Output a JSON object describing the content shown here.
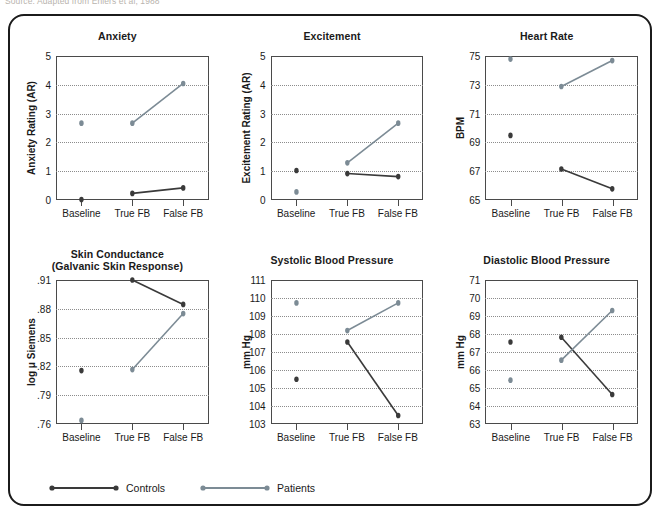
{
  "source_note": "Source: Adapted from Ehlers et al, 1988",
  "series_colors": {
    "controls": "#3a3a3a",
    "patients": "#7c8b95"
  },
  "legend": {
    "items": [
      {
        "label": "Controls",
        "key": "controls",
        "swatch": "line-with-dots-icon"
      },
      {
        "label": "Patients",
        "key": "patients",
        "swatch": "line-with-dots-icon"
      }
    ]
  },
  "chart_data": [
    {
      "type": "line",
      "title": "Anxiety",
      "xlabel": "",
      "ylabel": "Anxiety Rating (AR)",
      "categories": [
        "Baseline",
        "True FB",
        "False FB"
      ],
      "ylim": [
        0,
        5
      ],
      "yticks": [
        0,
        1,
        2,
        3,
        4,
        5
      ],
      "ytick_labels": [
        "0",
        "1",
        "2",
        "3",
        "4",
        "5"
      ],
      "grid": true,
      "baseline_disconnected": true,
      "series": [
        {
          "name": "Controls",
          "key": "controls",
          "values": [
            0.3,
            0.5,
            0.68
          ]
        },
        {
          "name": "Patients",
          "key": "patients",
          "values": [
            2.8,
            2.8,
            4.1
          ]
        }
      ]
    },
    {
      "type": "line",
      "title": "Excitement",
      "xlabel": "",
      "ylabel": "Excitement Rating (AR)",
      "categories": [
        "Baseline",
        "True FB",
        "False FB"
      ],
      "ylim": [
        0,
        5
      ],
      "yticks": [
        0,
        1,
        2,
        3,
        4,
        5
      ],
      "ytick_labels": [
        "0",
        "1",
        "2",
        "3",
        "4",
        "5"
      ],
      "grid": true,
      "baseline_disconnected": true,
      "series": [
        {
          "name": "Controls",
          "key": "controls",
          "values": [
            1.25,
            1.15,
            1.05
          ]
        },
        {
          "name": "Patients",
          "key": "patients",
          "values": [
            0.55,
            1.5,
            2.8
          ]
        }
      ]
    },
    {
      "type": "line",
      "title": "Heart Rate",
      "xlabel": "",
      "ylabel": "BPM",
      "categories": [
        "Baseline",
        "True FB",
        "False FB"
      ],
      "ylim": [
        65,
        75
      ],
      "yticks": [
        65,
        67,
        69,
        71,
        73,
        75
      ],
      "ytick_labels": [
        "65",
        "67",
        "69",
        "71",
        "73",
        "75"
      ],
      "grid": true,
      "baseline_disconnected": true,
      "series": [
        {
          "name": "Controls",
          "key": "controls",
          "values": [
            69.8,
            67.6,
            66.3
          ]
        },
        {
          "name": "Patients",
          "key": "patients",
          "values": [
            74.8,
            73.0,
            74.7
          ]
        }
      ]
    },
    {
      "type": "line",
      "title": "Skin Conductance\n(Galvanic Skin Response)",
      "title_lines": [
        "Skin Conductance",
        "(Galvanic Skin Response)"
      ],
      "xlabel": "",
      "ylabel": "log μ Siemens",
      "categories": [
        "Baseline",
        "True FB",
        "False FB"
      ],
      "ylim": [
        0.76,
        0.91
      ],
      "yticks": [
        0.76,
        0.79,
        0.82,
        0.85,
        0.88,
        0.91
      ],
      "ytick_labels": [
        ".76",
        ".79",
        ".82",
        ".85",
        ".88",
        ".91"
      ],
      "grid": true,
      "baseline_disconnected": true,
      "series": [
        {
          "name": "Controls",
          "key": "controls",
          "values": [
            0.821,
            0.91,
            0.886
          ]
        },
        {
          "name": "Patients",
          "key": "patients",
          "values": [
            0.772,
            0.822,
            0.877
          ]
        }
      ]
    },
    {
      "type": "line",
      "title": "Systolic Blood Pressure",
      "xlabel": "",
      "ylabel": "mm Hg",
      "categories": [
        "Baseline",
        "True FB",
        "False FB"
      ],
      "ylim": [
        103,
        111
      ],
      "yticks": [
        103,
        104,
        105,
        106,
        107,
        108,
        109,
        110,
        111
      ],
      "ytick_labels": [
        "103",
        "104",
        "105",
        "106",
        "107",
        "108",
        "109",
        "110",
        "111"
      ],
      "grid": true,
      "baseline_disconnected": true,
      "series": [
        {
          "name": "Controls",
          "key": "controls",
          "values": [
            105.8,
            107.75,
            103.9
          ]
        },
        {
          "name": "Patients",
          "key": "patients",
          "values": [
            109.8,
            108.35,
            109.8
          ]
        }
      ]
    },
    {
      "type": "line",
      "title": "Diastolic Blood Pressure",
      "xlabel": "",
      "ylabel": "mm Hg",
      "categories": [
        "Baseline",
        "True FB",
        "False FB"
      ],
      "ylim": [
        63,
        71
      ],
      "yticks": [
        63,
        64,
        65,
        66,
        67,
        68,
        69,
        70,
        71
      ],
      "ytick_labels": [
        "63",
        "64",
        "65",
        "66",
        "67",
        "68",
        "69",
        "70",
        "71"
      ],
      "grid": true,
      "baseline_disconnected": true,
      "series": [
        {
          "name": "Controls",
          "key": "controls",
          "values": [
            67.75,
            68.0,
            65.0
          ]
        },
        {
          "name": "Patients",
          "key": "patients",
          "values": [
            65.75,
            66.8,
            69.4
          ]
        }
      ]
    }
  ]
}
